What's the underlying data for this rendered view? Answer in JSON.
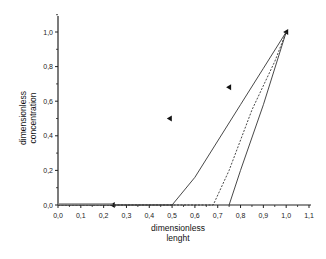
{
  "chart_data": {
    "type": "line",
    "title": "",
    "xlabel": [
      "dimensionless",
      "lenght"
    ],
    "ylabel": [
      "dimensionless",
      "concentration"
    ],
    "xlim": [
      0.0,
      1.1
    ],
    "ylim": [
      0.0,
      1.05
    ],
    "x_ticks": [
      "0,0",
      "0,1",
      "0,2",
      "0,3",
      "0,4",
      "0,5",
      "0,6",
      "0,7",
      "0,8",
      "0,9",
      "1,0",
      "1,1"
    ],
    "y_ticks": [
      "0,0",
      "0,2",
      "0,4",
      "0,6",
      "0,8",
      "1,0"
    ],
    "grid": false,
    "legend": "none",
    "series": [
      {
        "name": "markers",
        "style": "triangle-left",
        "points": [
          [
            0.24,
            0.0
          ],
          [
            0.49,
            0.5
          ],
          [
            0.75,
            0.68
          ],
          [
            1.0,
            1.0
          ]
        ]
      },
      {
        "name": "curve-1 (solid)",
        "style": "solid",
        "points": [
          [
            0.0,
            0.0
          ],
          [
            0.5,
            0.0
          ],
          [
            0.6,
            0.16
          ],
          [
            0.7,
            0.37
          ],
          [
            0.8,
            0.58
          ],
          [
            0.9,
            0.79
          ],
          [
            1.0,
            1.0
          ]
        ]
      },
      {
        "name": "curve-2 (dashed)",
        "style": "dashed",
        "points": [
          [
            0.0,
            0.0
          ],
          [
            0.68,
            0.0
          ],
          [
            0.75,
            0.2
          ],
          [
            0.85,
            0.55
          ],
          [
            0.95,
            0.83
          ],
          [
            1.0,
            1.0
          ]
        ]
      },
      {
        "name": "curve-3 (solid)",
        "style": "solid",
        "points": [
          [
            0.75,
            0.0
          ],
          [
            0.8,
            0.2
          ],
          [
            0.9,
            0.58
          ],
          [
            1.0,
            1.0
          ]
        ]
      }
    ]
  }
}
